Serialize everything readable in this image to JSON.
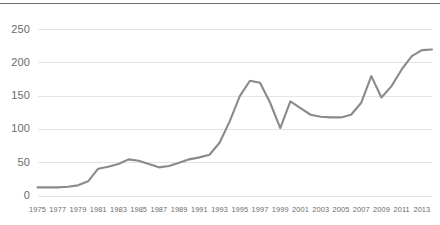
{
  "chart_data": {
    "type": "line",
    "title": "",
    "subtitle": "",
    "xlabel": "",
    "ylabel": "",
    "grid": "horizontal",
    "legend": "none",
    "line_color": "#8a8a8e",
    "grid_color": "#e4e4e6",
    "axis_text_color": "#6b6b6b",
    "background_color": "#ffffff",
    "top_rule_color": "#6f6f6f",
    "xlim": [
      1975,
      2014
    ],
    "ylim": [
      0,
      265
    ],
    "yticks": [
      0,
      50,
      100,
      150,
      200,
      250
    ],
    "ytick_labels": [
      "0",
      "50",
      "100",
      "150",
      "200",
      "250"
    ],
    "xtick_labels": [
      "1975",
      "1977",
      "1979",
      "1981",
      "1983",
      "1985",
      "1987",
      "1989",
      "1991",
      "1993",
      "1995",
      "1997",
      "1999",
      "2001",
      "2003",
      "2005",
      "2007",
      "2009",
      "2011",
      "2013"
    ],
    "x": [
      1975,
      1976,
      1977,
      1978,
      1979,
      1980,
      1981,
      1982,
      1983,
      1984,
      1985,
      1986,
      1987,
      1988,
      1989,
      1990,
      1991,
      1992,
      1993,
      1994,
      1995,
      1996,
      1997,
      1998,
      1999,
      2000,
      2001,
      2002,
      2003,
      2004,
      2005,
      2006,
      2007,
      2008,
      2009,
      2010,
      2011,
      2012,
      2013,
      2014
    ],
    "values": [
      13,
      13,
      13,
      14,
      16,
      22,
      41,
      44,
      48,
      55,
      53,
      48,
      43,
      45,
      50,
      55,
      58,
      62,
      80,
      112,
      150,
      173,
      170,
      140,
      102,
      142,
      132,
      122,
      119,
      118,
      118,
      122,
      140,
      180,
      148,
      165,
      190,
      210,
      219,
      220
    ],
    "series": [
      {
        "name": "series-1",
        "values": [
          13,
          13,
          13,
          14,
          16,
          22,
          41,
          44,
          48,
          55,
          53,
          48,
          43,
          45,
          50,
          55,
          58,
          62,
          80,
          112,
          150,
          173,
          170,
          140,
          102,
          142,
          132,
          122,
          119,
          118,
          118,
          122,
          140,
          180,
          148,
          165,
          190,
          210,
          219,
          220
        ]
      }
    ]
  }
}
